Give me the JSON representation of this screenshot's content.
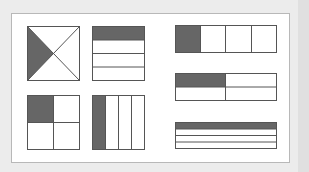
{
  "diagram": {
    "title": "",
    "colors": {
      "background": "#ececec",
      "panel": "#ffffff",
      "shaded": "#666666",
      "stroke": "#555555"
    },
    "shapes": [
      {
        "id": "square-diagonals",
        "type": "square",
        "division": "diagonals",
        "parts": 4,
        "shaded": 1
      },
      {
        "id": "square-horizontal-rows",
        "type": "square",
        "division": "horizontal",
        "parts": 4,
        "shaded": 1
      },
      {
        "id": "square-quadrants",
        "type": "square",
        "division": "grid-2x2",
        "parts": 4,
        "shaded": 1
      },
      {
        "id": "square-vertical-columns",
        "type": "square",
        "division": "vertical",
        "parts": 4,
        "shaded": 1
      },
      {
        "id": "rect-vertical-columns",
        "type": "rectangle",
        "division": "vertical",
        "parts": 4,
        "shaded": 1
      },
      {
        "id": "rect-quadrants",
        "type": "rectangle",
        "division": "grid-2x2",
        "parts": 4,
        "shaded": 1
      },
      {
        "id": "rect-horizontal-rows",
        "type": "rectangle",
        "division": "horizontal",
        "parts": 4,
        "shaded": 1
      }
    ]
  }
}
